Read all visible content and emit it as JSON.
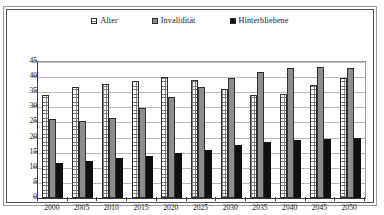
{
  "legend": {
    "items": [
      {
        "label": "Alter",
        "swatch": "dotted-white-square-icon",
        "color": "#ffffff"
      },
      {
        "label": "Invalidität",
        "swatch": "gray-square-icon",
        "color": "#8e8e8e"
      },
      {
        "label": "Hinterbliebene",
        "swatch": "black-square-icon",
        "color": "#111111"
      }
    ]
  },
  "axis": {
    "y_ticks": [
      "0",
      "5",
      "10",
      "15",
      "20",
      "25",
      "30",
      "35",
      "40",
      "45"
    ],
    "x_ticks": [
      "2000",
      "2005",
      "2010",
      "2015",
      "2020",
      "2025",
      "2030",
      "2035",
      "2040",
      "2045",
      "2050"
    ]
  },
  "scan_artifact": "",
  "chart_data": {
    "type": "bar",
    "title": "",
    "subtitle": "",
    "xlabel": "",
    "ylabel": "",
    "categories": [
      "2000",
      "2005",
      "2010",
      "2015",
      "2020",
      "2025",
      "2030",
      "2035",
      "2040",
      "2045",
      "2050"
    ],
    "series": [
      {
        "name": "Alter",
        "color": "#ffffff",
        "pattern": "dotted",
        "values": [
          34.0,
          36.7,
          37.6,
          38.8,
          40.1,
          39.1,
          36.0,
          34.1,
          34.4,
          37.3,
          39.7
        ]
      },
      {
        "name": "Invalidität",
        "color": "#8e8e8e",
        "pattern": "solid-gray",
        "values": [
          26.3,
          25.5,
          26.6,
          29.7,
          33.4,
          36.8,
          39.6,
          41.8,
          43.0,
          43.3,
          42.9
        ]
      },
      {
        "name": "Hinterbliebene",
        "color": "#111111",
        "pattern": "solid-black",
        "values": [
          11.5,
          12.3,
          13.1,
          13.9,
          14.8,
          16.0,
          17.4,
          18.6,
          19.1,
          19.4,
          20.0
        ]
      }
    ],
    "ylim": [
      0,
      45
    ],
    "ytick_step": 5,
    "grid": true,
    "grid_axis": "y",
    "legend_position": "top-center"
  }
}
